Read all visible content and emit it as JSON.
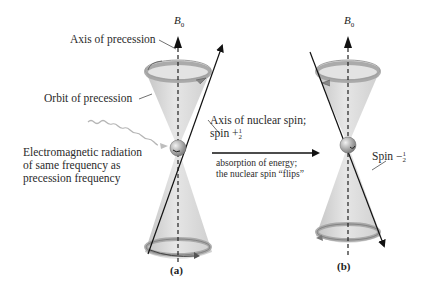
{
  "figure": {
    "panels": [
      {
        "id": "a",
        "label": "(a)",
        "field_label": "B",
        "field_sub": "0",
        "spin_state": "+½"
      },
      {
        "id": "b",
        "label": "(b)",
        "field_label": "B",
        "field_sub": "0",
        "spin_state": "−½"
      }
    ],
    "labels": {
      "axis_of_precession": "Axis of precession",
      "orbit_of_precession": "Orbit of precession",
      "axis_of_nuclear_spin_line1": "Axis of nuclear spin;",
      "axis_of_nuclear_spin_line2": "spin +",
      "em_radiation_line1": "Electromagnetic radiation",
      "em_radiation_line2": "of same frequency as",
      "em_radiation_line3": "precession frequency",
      "absorption_line1": "absorption of energy;",
      "absorption_line2": "the nuclear spin “flips”",
      "spin_minus": "Spin −",
      "frac_num": "1",
      "frac_den": "2"
    },
    "colors": {
      "cone_fill": "#d9d9d9",
      "cone_shade": "#bdbdbd",
      "ring": "#a8a8a8",
      "line": "#1a1a1a",
      "wavy": "#b0b0b0",
      "sphere": "#9a9a9a"
    }
  }
}
